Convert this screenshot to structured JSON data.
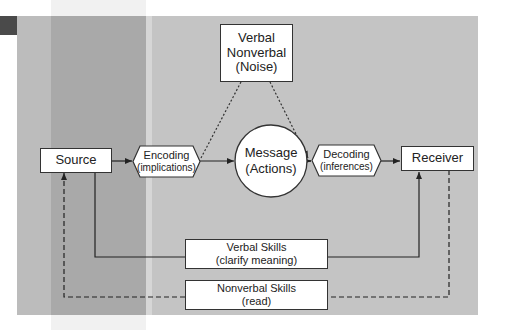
{
  "diagram": {
    "type": "communication-process-model",
    "colors": {
      "panel_background": "#c4c4c4",
      "node_fill": "#ffffff",
      "stroke": "#333333",
      "text": "#222222"
    },
    "nodes": {
      "noise": {
        "line1": "Verbal",
        "line2": "Nonverbal",
        "line3": "(Noise)"
      },
      "source": {
        "label": "Source"
      },
      "encoding": {
        "label": "Encoding",
        "sublabel": "(implications)"
      },
      "message": {
        "label": "Message",
        "sublabel": "(Actions)"
      },
      "decoding": {
        "label": "Decoding",
        "sublabel": "(inferences)"
      },
      "receiver": {
        "label": "Receiver"
      },
      "verbal_skills": {
        "label": "Verbal Skills",
        "sublabel": "(clarify meaning)"
      },
      "nonverbal_skills": {
        "label": "Nonverbal Skills",
        "sublabel": "(read)"
      }
    },
    "edges": [
      {
        "from": "source",
        "to": "encoding",
        "style": "solid",
        "arrow": true
      },
      {
        "from": "encoding",
        "to": "message",
        "style": "solid",
        "arrow": true
      },
      {
        "from": "message",
        "to": "decoding",
        "style": "solid",
        "arrow": true
      },
      {
        "from": "decoding",
        "to": "receiver",
        "style": "solid",
        "arrow": true
      },
      {
        "from": "noise",
        "to": "encoding",
        "style": "dotted",
        "arrow": false
      },
      {
        "from": "noise",
        "to": "decoding",
        "style": "dotted",
        "arrow": true
      },
      {
        "from": "source",
        "to": "receiver",
        "via": "verbal_skills",
        "style": "solid",
        "arrow": true
      },
      {
        "from": "receiver",
        "to": "source",
        "via": "nonverbal_skills",
        "style": "dashed",
        "arrow": true
      }
    ]
  }
}
